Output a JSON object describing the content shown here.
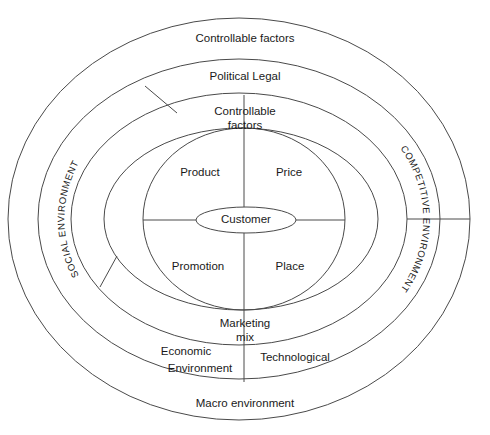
{
  "diagram": {
    "stroke_color": "#4a4a4a",
    "text_color": "#1a1a1a",
    "background_color": "#ffffff",
    "rings": {
      "outer": {
        "top_label": "Controllable factors",
        "bottom_label": "Macro environment"
      },
      "second": {
        "top_label": "Political Legal",
        "bottom_left_label": "Economic",
        "bottom_left_label_2": "Environment",
        "bottom_right_label": "Technological"
      },
      "third": {
        "top_label_line1": "Controllable",
        "top_label_line2": "factors",
        "bottom_label_line1": "Marketing",
        "bottom_label_line2": "mix"
      }
    },
    "side_labels": {
      "left": "SOCIAL ENVIRONMENT",
      "right": "COMPETITIVE ENVIRONMENT"
    },
    "marketing_mix": {
      "top_left": "Product",
      "top_right": "Price",
      "bottom_left": "Promotion",
      "bottom_right": "Place"
    },
    "core": {
      "label": "Customer"
    }
  }
}
